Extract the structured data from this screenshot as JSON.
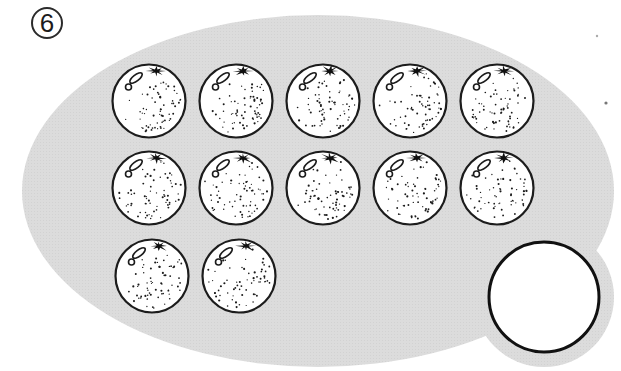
{
  "problem_number": "6",
  "scene": {
    "type": "counting-illustration",
    "fruit": "orange",
    "orange_rows": [
      5,
      5,
      2
    ],
    "orange_total": 12,
    "empty_circle_count": 1,
    "colors": {
      "background": "#ffffff",
      "set_fill": "#dcdcdc",
      "halftone_dot": "#d0d0d0",
      "outline": "#1c1c1c",
      "fruit_fill": "#ffffff",
      "empty_circle_fill": "#ffffff",
      "stipple": "#1b1b1b"
    }
  }
}
